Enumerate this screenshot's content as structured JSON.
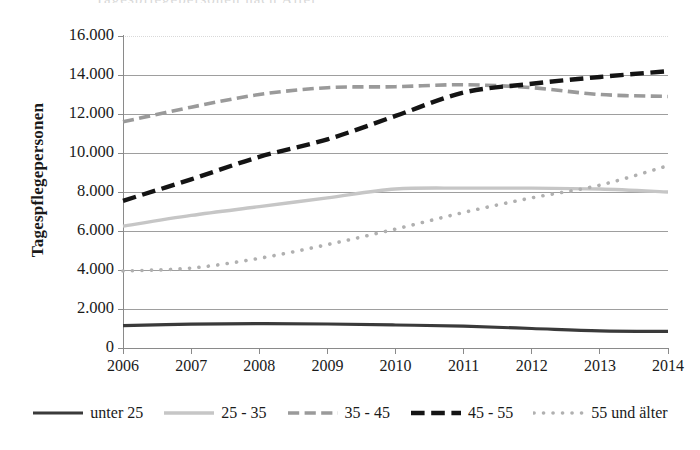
{
  "chart_data": {
    "type": "line",
    "title": "",
    "xlabel": "",
    "ylabel": "Tagespflegepersonen",
    "x": [
      2006,
      2007,
      2008,
      2009,
      2010,
      2011,
      2012,
      2013,
      2014
    ],
    "categories": [
      "2006",
      "2007",
      "2008",
      "2009",
      "2010",
      "2011",
      "2012",
      "2013",
      "2014"
    ],
    "ylim": [
      0,
      16000
    ],
    "ytick_values": [
      0,
      2000,
      4000,
      6000,
      8000,
      10000,
      12000,
      14000,
      16000
    ],
    "ytick_labels": [
      "0",
      "2.000",
      "4.000",
      "6.000",
      "8.000",
      "10.000",
      "12.000",
      "14.000",
      "16.000"
    ],
    "grid": true,
    "legend_position": "bottom",
    "series": [
      {
        "name": "unter 25",
        "values": [
          1150,
          1220,
          1250,
          1230,
          1180,
          1120,
          1000,
          880,
          850
        ],
        "color": "#3a3a3a",
        "style": "solid",
        "width": 3.2
      },
      {
        "name": "25 - 35",
        "values": [
          6250,
          6800,
          7250,
          7700,
          8150,
          8200,
          8200,
          8150,
          8000
        ],
        "color": "#c6c6c6",
        "style": "solid",
        "width": 3.4
      },
      {
        "name": "35 - 45",
        "values": [
          11600,
          12350,
          13000,
          13350,
          13400,
          13500,
          13350,
          13000,
          12900
        ],
        "color": "#9a9a9a",
        "style": "dashed",
        "width": 3.6
      },
      {
        "name": "45 - 55",
        "values": [
          7550,
          8650,
          9800,
          10700,
          11900,
          13100,
          13550,
          13900,
          14200
        ],
        "color": "#141414",
        "style": "dashed",
        "width": 4.4
      },
      {
        "name": "55 und älter",
        "values": [
          3950,
          4100,
          4600,
          5300,
          6100,
          6950,
          7700,
          8350,
          9350
        ],
        "color": "#b0b0b0",
        "style": "dotted",
        "width": 3.6
      }
    ]
  },
  "plot": {
    "left": 123,
    "right": 668,
    "top": 36,
    "bottom": 348
  },
  "cut_title_text": "Tagespflegepersonen nach Alter"
}
